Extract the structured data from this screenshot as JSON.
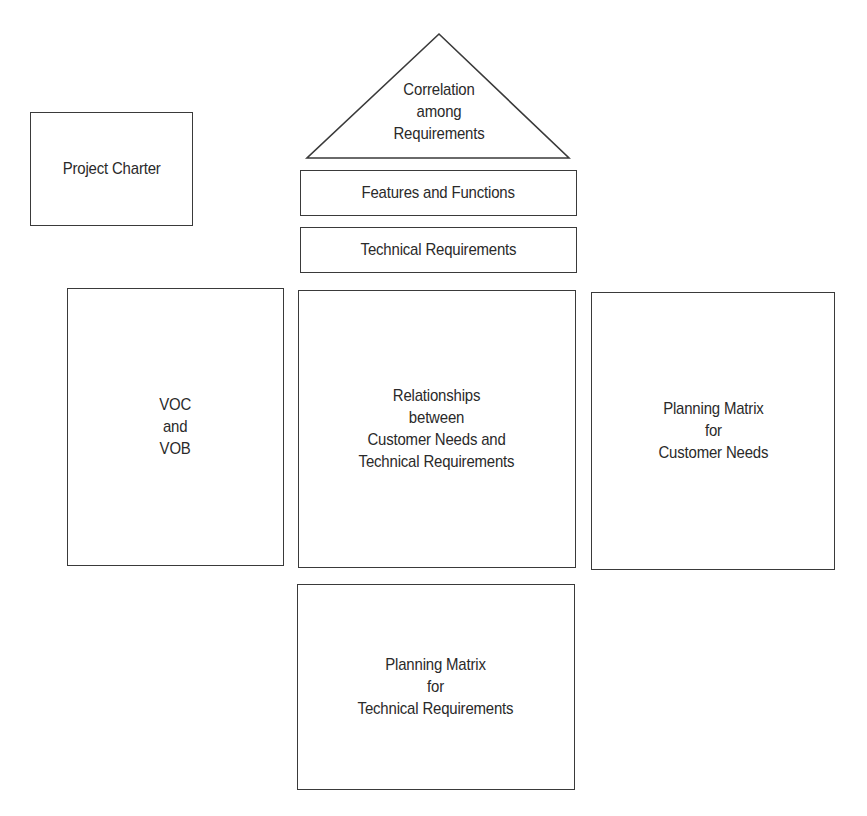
{
  "diagram": {
    "type": "house-of-quality",
    "project_charter": {
      "label": "Project Charter"
    },
    "roof": {
      "label": "Correlation\namong\nRequirements"
    },
    "features_functions": {
      "label": "Features and Functions"
    },
    "technical_requirements": {
      "label": "Technical Requirements"
    },
    "voc_vob": {
      "label": "VOC\nand\nVOB"
    },
    "relationships": {
      "label": "Relationships\nbetween\nCustomer Needs and\nTechnical Requirements"
    },
    "planning_customer": {
      "label": "Planning Matrix\nfor\nCustomer Needs"
    },
    "planning_technical": {
      "label": "Planning Matrix\nfor\nTechnical Requirements"
    }
  },
  "colors": {
    "stroke": "#3a3a3a",
    "text": "#2a2a2a",
    "background": "#ffffff"
  }
}
